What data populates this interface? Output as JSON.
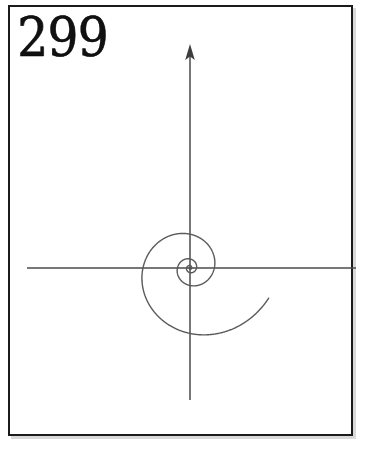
{
  "figure": {
    "number_label": "299",
    "caption": "",
    "background_color": "#ffffff",
    "border_color": "#1b1b1b",
    "line_color": "#5a5a5a",
    "axis_color": "#4a4a4a"
  },
  "plate": {
    "left": 8,
    "top": 5,
    "width": 345,
    "height": 431,
    "border_width": 2
  },
  "chart_data": {
    "type": "line",
    "title": "299",
    "subtitle": "",
    "xlabel": "",
    "ylabel": "",
    "grid": false,
    "legend": null,
    "curve_name": "logarithmic spiral",
    "equation": "r = a * e^(b*theta)",
    "parameters": {
      "a": 6.5,
      "b": 0.21
    },
    "origin_px": [
      190,
      268
    ],
    "axes": {
      "x_axis": {
        "from_px": [
          27,
          268
        ],
        "to_px": [
          356,
          268
        ],
        "arrow": false
      },
      "y_axis": {
        "from_px": [
          190,
          400
        ],
        "to_px": [
          190,
          45
        ],
        "arrow": true,
        "arrow_at": "top"
      }
    },
    "axis_crossings_px": {
      "right_of_origin": [
        193,
        216,
        266
      ],
      "left_of_origin": [
        186,
        160,
        43
      ],
      "above_origin": [
        265,
        196,
        70
      ],
      "below_origin": [
        272,
        311,
        378
      ]
    },
    "theta_range_rad": [
      -9.4,
      12.2
    ],
    "turns_visible": 3.4,
    "xlim": [
      27,
      356
    ],
    "ylim": [
      45,
      400
    ],
    "series": [
      {
        "name": "spiral",
        "description": "equiangular spiral winding outward counterclockwise from the origin",
        "values": []
      }
    ]
  }
}
